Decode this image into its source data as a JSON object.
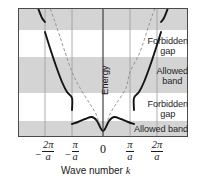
{
  "figure": {
    "kind": "band-structure-diagram",
    "background": "#ffffff",
    "frame": {
      "x": 18,
      "y": 8,
      "width": 170,
      "height": 129,
      "border_color": "#555555"
    },
    "energy_axis_label": "Energy",
    "x_axis_title_prefix": "Wave number ",
    "x_axis_title_symbol": "k"
  },
  "colors": {
    "allowed_band_fill": "#d4d4d4",
    "forbidden_gap_fill": "#ffffff",
    "solid_curve": "#141414",
    "dashed_curve": "#8a8a8a",
    "gridline": "#9a9a9a",
    "energy_axis": "#303030",
    "frame": "#4a4a4a",
    "text": "#242424"
  },
  "bands": [
    {
      "label": "Allowed band",
      "type": "allowed",
      "top": 8,
      "bottom": 30,
      "show_label": false
    },
    {
      "label": "Forbidden gap",
      "type": "forbidden",
      "top": 30,
      "bottom": 57,
      "show_label": true
    },
    {
      "label": "Allowed band",
      "type": "allowed",
      "top": 57,
      "bottom": 93,
      "show_label": true
    },
    {
      "label": "Forbidden gap",
      "type": "forbidden",
      "top": 93,
      "bottom": 121,
      "show_label": true
    },
    {
      "label": "Allowed band",
      "type": "allowed",
      "top": 121,
      "bottom": 137,
      "show_label": true
    }
  ],
  "band_labels": [
    {
      "line1": "Forbidden",
      "line2": "gap",
      "x": 188,
      "y": 36
    },
    {
      "line1": "Allowed",
      "line2": "band",
      "x": 188,
      "y": 66
    },
    {
      "line1": "Forbidden",
      "line2": "gap",
      "x": 188,
      "y": 99
    },
    {
      "line1": "Allowed band",
      "line2": "",
      "x": 188,
      "y": 124
    }
  ],
  "xticks": [
    {
      "label_num": "2π",
      "label_den": "a",
      "negative": true,
      "value": -2,
      "px": 45
    },
    {
      "label_num": "π",
      "label_den": "a",
      "negative": true,
      "value": -1,
      "px": 72
    },
    {
      "label_num": "0",
      "label_den": "",
      "negative": false,
      "value": 0,
      "px": 103
    },
    {
      "label_num": "π",
      "label_den": "a",
      "negative": false,
      "value": 1,
      "px": 130
    },
    {
      "label_num": "2π",
      "label_den": "a",
      "negative": false,
      "value": 2,
      "px": 157
    }
  ],
  "chart_data": {
    "type": "line",
    "title": "",
    "xlabel": "Wave number k",
    "ylabel": "Energy",
    "xlim": [
      -2.6,
      2.6
    ],
    "ylim": [
      0,
      1
    ],
    "grid": false,
    "x_tick_values": [
      -2,
      -1,
      0,
      1,
      2
    ],
    "x_tick_labels": [
      "-2π/a",
      "-π/a",
      "0",
      "π/a",
      "2π/a"
    ],
    "annotations": [
      "Forbidden gap",
      "Allowed band",
      "Forbidden gap",
      "Allowed band"
    ],
    "series": [
      {
        "name": "Free-electron parabola",
        "style": "dashed",
        "color": "#8a8a8a",
        "points_px": [
          [
            45,
            -6
          ],
          [
            55,
            22
          ],
          [
            65,
            52
          ],
          [
            72,
            72
          ],
          [
            80,
            88
          ],
          [
            90,
            104
          ],
          [
            96,
            114
          ],
          [
            103,
            131
          ],
          [
            110,
            114
          ],
          [
            116,
            104
          ],
          [
            126,
            88
          ],
          [
            130,
            72
          ],
          [
            140,
            52
          ],
          [
            150,
            22
          ],
          [
            160,
            -6
          ]
        ]
      },
      {
        "name": "Band electron E(k) lower band",
        "style": "solid",
        "color": "#141414",
        "points_px": [
          [
            72,
            124
          ],
          [
            78,
            122
          ],
          [
            85,
            119
          ],
          [
            92,
            117
          ],
          [
            97,
            121
          ],
          [
            103,
            131
          ],
          [
            109,
            121
          ],
          [
            114,
            117
          ],
          [
            121,
            119
          ],
          [
            128,
            122
          ],
          [
            134,
            124
          ]
        ]
      },
      {
        "name": "Band electron E(k) second band left",
        "style": "solid",
        "color": "#141414",
        "points_px": [
          [
            45,
            32
          ],
          [
            50,
            48
          ],
          [
            56,
            66
          ],
          [
            62,
            82
          ],
          [
            67,
            92
          ],
          [
            72,
            98
          ],
          [
            72,
            110
          ]
        ]
      },
      {
        "name": "Band electron E(k) second band right",
        "style": "solid",
        "color": "#141414",
        "points_px": [
          [
            134,
            110
          ],
          [
            134,
            98
          ],
          [
            139,
            92
          ],
          [
            144,
            82
          ],
          [
            150,
            66
          ],
          [
            156,
            48
          ],
          [
            161,
            32
          ]
        ]
      },
      {
        "name": "Band electron E(k) third band left",
        "style": "solid",
        "color": "#141414",
        "points_px": [
          [
            33,
            -6
          ],
          [
            38,
            8
          ],
          [
            42,
            18
          ],
          [
            45,
            22
          ]
        ]
      },
      {
        "name": "Band electron E(k) third band right",
        "style": "solid",
        "color": "#141414",
        "points_px": [
          [
            161,
            22
          ],
          [
            164,
            18
          ],
          [
            168,
            8
          ],
          [
            173,
            -6
          ]
        ]
      }
    ]
  }
}
